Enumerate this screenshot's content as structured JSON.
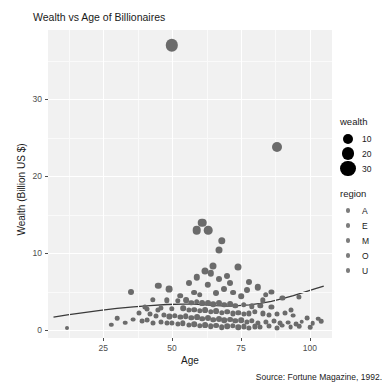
{
  "chart_data": {
    "type": "scatter",
    "title": "Wealth vs Age of Billionaires",
    "xlabel": "Age",
    "ylabel": "Wealth (Billion US $)",
    "caption": "Source: Fortune Magazine, 1992.",
    "xlim": [
      5,
      108
    ],
    "ylim": [
      -1,
      39
    ],
    "xticks": [
      25,
      50,
      75,
      100
    ],
    "yticks": [
      0,
      10,
      20,
      30
    ],
    "xtick_labels": [
      "25",
      "50",
      "75",
      "100"
    ],
    "ytick_labels": [
      "0",
      "10",
      "20",
      "30"
    ],
    "grid": true,
    "legend_position": "right",
    "point_color": "#6b6b6b",
    "panel_color": "#f1f1f1",
    "grid_color": "#ffffff",
    "trend_color": "#3a3a3a",
    "legends": [
      {
        "title": "wealth",
        "type": "size",
        "entries": [
          {
            "label": "10",
            "size": 5
          },
          {
            "label": "20",
            "size": 6.4
          },
          {
            "label": "30",
            "size": 7.6
          }
        ]
      },
      {
        "title": "region",
        "type": "color",
        "entries": [
          {
            "label": "A",
            "size": 2.2
          },
          {
            "label": "E",
            "size": 2.2
          },
          {
            "label": "M",
            "size": 2.2
          },
          {
            "label": "O",
            "size": 2.2
          },
          {
            "label": "U",
            "size": 2.2
          }
        ]
      }
    ],
    "trend_line": [
      [
        7,
        1.7
      ],
      [
        12,
        2.0
      ],
      [
        18,
        2.3
      ],
      [
        24,
        2.6
      ],
      [
        30,
        2.85
      ],
      [
        36,
        3.05
      ],
      [
        42,
        3.2
      ],
      [
        48,
        3.35
      ],
      [
        54,
        3.4
      ],
      [
        58,
        3.4
      ],
      [
        62,
        3.3
      ],
      [
        66,
        3.2
      ],
      [
        70,
        3.15
      ],
      [
        74,
        3.2
      ],
      [
        78,
        3.3
      ],
      [
        82,
        3.5
      ],
      [
        86,
        3.75
      ],
      [
        90,
        4.1
      ],
      [
        94,
        4.5
      ],
      [
        98,
        4.95
      ],
      [
        102,
        5.4
      ],
      [
        105,
        5.75
      ]
    ],
    "points": [
      {
        "x": 50,
        "y": 37.0,
        "r": 6.2
      },
      {
        "x": 88,
        "y": 23.8,
        "r": 5.0
      },
      {
        "x": 61,
        "y": 14.0,
        "r": 4.3
      },
      {
        "x": 59,
        "y": 13.0,
        "r": 4.3
      },
      {
        "x": 63,
        "y": 13.0,
        "r": 4.3
      },
      {
        "x": 68,
        "y": 11.6,
        "r": 3.7
      },
      {
        "x": 67,
        "y": 10.4,
        "r": 3.5
      },
      {
        "x": 65,
        "y": 8.3,
        "r": 3.5
      },
      {
        "x": 74,
        "y": 8.2,
        "r": 3.5
      },
      {
        "x": 62,
        "y": 7.7,
        "r": 3.5
      },
      {
        "x": 64,
        "y": 7.4,
        "r": 3.2
      },
      {
        "x": 56,
        "y": 6.2,
        "r": 3.0
      },
      {
        "x": 71,
        "y": 6.1,
        "r": 3.0
      },
      {
        "x": 45,
        "y": 5.8,
        "r": 3.2
      },
      {
        "x": 81,
        "y": 5.6,
        "r": 3.2
      },
      {
        "x": 35,
        "y": 5.0,
        "r": 3.0
      },
      {
        "x": 49,
        "y": 5.4,
        "r": 3.4
      },
      {
        "x": 69,
        "y": 5.3,
        "r": 3.0
      },
      {
        "x": 77,
        "y": 5.2,
        "r": 3.0
      },
      {
        "x": 58,
        "y": 4.9,
        "r": 2.9
      },
      {
        "x": 66,
        "y": 4.8,
        "r": 3.0
      },
      {
        "x": 72,
        "y": 4.9,
        "r": 2.9
      },
      {
        "x": 53,
        "y": 4.5,
        "r": 2.8
      },
      {
        "x": 60,
        "y": 4.6,
        "r": 2.8
      },
      {
        "x": 75,
        "y": 4.4,
        "r": 2.8
      },
      {
        "x": 84,
        "y": 4.6,
        "r": 2.8
      },
      {
        "x": 90,
        "y": 4.2,
        "r": 2.6
      },
      {
        "x": 96,
        "y": 4.3,
        "r": 2.6
      },
      {
        "x": 43,
        "y": 4.0,
        "r": 2.7
      },
      {
        "x": 48,
        "y": 3.9,
        "r": 2.7
      },
      {
        "x": 52,
        "y": 3.8,
        "r": 2.7
      },
      {
        "x": 55,
        "y": 3.9,
        "r": 2.9
      },
      {
        "x": 57,
        "y": 3.6,
        "r": 2.7
      },
      {
        "x": 59,
        "y": 3.7,
        "r": 2.8
      },
      {
        "x": 61,
        "y": 3.5,
        "r": 2.9
      },
      {
        "x": 63,
        "y": 3.6,
        "r": 3.0
      },
      {
        "x": 65,
        "y": 3.4,
        "r": 2.8
      },
      {
        "x": 67,
        "y": 3.5,
        "r": 3.0
      },
      {
        "x": 69,
        "y": 3.3,
        "r": 2.8
      },
      {
        "x": 71,
        "y": 3.4,
        "r": 2.9
      },
      {
        "x": 73,
        "y": 3.2,
        "r": 2.7
      },
      {
        "x": 76,
        "y": 3.3,
        "r": 2.8
      },
      {
        "x": 79,
        "y": 3.1,
        "r": 2.7
      },
      {
        "x": 82,
        "y": 3.2,
        "r": 2.7
      },
      {
        "x": 86,
        "y": 3.0,
        "r": 2.6
      },
      {
        "x": 40,
        "y": 3.0,
        "r": 2.6
      },
      {
        "x": 46,
        "y": 2.9,
        "r": 2.6
      },
      {
        "x": 50,
        "y": 2.8,
        "r": 2.7
      },
      {
        "x": 54,
        "y": 2.9,
        "r": 2.8
      },
      {
        "x": 56,
        "y": 2.6,
        "r": 2.6
      },
      {
        "x": 58,
        "y": 2.7,
        "r": 2.8
      },
      {
        "x": 60,
        "y": 2.5,
        "r": 2.7
      },
      {
        "x": 62,
        "y": 2.6,
        "r": 2.9
      },
      {
        "x": 64,
        "y": 2.4,
        "r": 2.7
      },
      {
        "x": 66,
        "y": 2.5,
        "r": 2.9
      },
      {
        "x": 68,
        "y": 2.3,
        "r": 2.7
      },
      {
        "x": 70,
        "y": 2.4,
        "r": 2.8
      },
      {
        "x": 72,
        "y": 2.2,
        "r": 2.6
      },
      {
        "x": 74,
        "y": 2.3,
        "r": 2.7
      },
      {
        "x": 76,
        "y": 2.1,
        "r": 2.6
      },
      {
        "x": 78,
        "y": 2.2,
        "r": 2.6
      },
      {
        "x": 80,
        "y": 2.4,
        "r": 2.7
      },
      {
        "x": 83,
        "y": 2.2,
        "r": 2.6
      },
      {
        "x": 85,
        "y": 2.0,
        "r": 2.5
      },
      {
        "x": 88,
        "y": 2.1,
        "r": 2.5
      },
      {
        "x": 91,
        "y": 2.3,
        "r": 2.5
      },
      {
        "x": 94,
        "y": 1.9,
        "r": 2.4
      },
      {
        "x": 99,
        "y": 1.6,
        "r": 2.4
      },
      {
        "x": 103,
        "y": 1.5,
        "r": 2.3
      },
      {
        "x": 38,
        "y": 2.2,
        "r": 2.5
      },
      {
        "x": 42,
        "y": 2.1,
        "r": 2.5
      },
      {
        "x": 44,
        "y": 1.9,
        "r": 2.5
      },
      {
        "x": 47,
        "y": 2.0,
        "r": 2.6
      },
      {
        "x": 49,
        "y": 1.8,
        "r": 2.6
      },
      {
        "x": 51,
        "y": 1.9,
        "r": 2.7
      },
      {
        "x": 53,
        "y": 1.7,
        "r": 2.6
      },
      {
        "x": 55,
        "y": 1.8,
        "r": 2.8
      },
      {
        "x": 57,
        "y": 1.6,
        "r": 2.7
      },
      {
        "x": 59,
        "y": 1.7,
        "r": 2.9
      },
      {
        "x": 61,
        "y": 1.5,
        "r": 2.8
      },
      {
        "x": 63,
        "y": 1.6,
        "r": 3.0
      },
      {
        "x": 65,
        "y": 1.4,
        "r": 2.8
      },
      {
        "x": 67,
        "y": 1.5,
        "r": 3.0
      },
      {
        "x": 69,
        "y": 1.3,
        "r": 2.8
      },
      {
        "x": 71,
        "y": 1.4,
        "r": 2.9
      },
      {
        "x": 73,
        "y": 1.2,
        "r": 2.7
      },
      {
        "x": 75,
        "y": 1.3,
        "r": 2.8
      },
      {
        "x": 77,
        "y": 1.1,
        "r": 2.6
      },
      {
        "x": 79,
        "y": 1.2,
        "r": 2.7
      },
      {
        "x": 81,
        "y": 1.0,
        "r": 2.6
      },
      {
        "x": 84,
        "y": 1.1,
        "r": 2.6
      },
      {
        "x": 87,
        "y": 1.2,
        "r": 2.5
      },
      {
        "x": 89,
        "y": 0.9,
        "r": 2.5
      },
      {
        "x": 92,
        "y": 1.0,
        "r": 2.4
      },
      {
        "x": 95,
        "y": 0.8,
        "r": 2.4
      },
      {
        "x": 97,
        "y": 1.1,
        "r": 2.3
      },
      {
        "x": 101,
        "y": 0.9,
        "r": 2.3
      },
      {
        "x": 104,
        "y": 1.2,
        "r": 2.3
      },
      {
        "x": 36,
        "y": 1.4,
        "r": 2.4
      },
      {
        "x": 39,
        "y": 1.2,
        "r": 2.4
      },
      {
        "x": 41,
        "y": 1.3,
        "r": 2.4
      },
      {
        "x": 43,
        "y": 1.0,
        "r": 2.5
      },
      {
        "x": 46,
        "y": 1.1,
        "r": 2.5
      },
      {
        "x": 48,
        "y": 0.9,
        "r": 2.5
      },
      {
        "x": 50,
        "y": 1.0,
        "r": 2.6
      },
      {
        "x": 52,
        "y": 0.8,
        "r": 2.6
      },
      {
        "x": 54,
        "y": 0.9,
        "r": 2.7
      },
      {
        "x": 56,
        "y": 0.7,
        "r": 2.6
      },
      {
        "x": 58,
        "y": 0.8,
        "r": 2.8
      },
      {
        "x": 60,
        "y": 0.6,
        "r": 2.7
      },
      {
        "x": 62,
        "y": 0.7,
        "r": 2.9
      },
      {
        "x": 64,
        "y": 0.5,
        "r": 2.8
      },
      {
        "x": 66,
        "y": 0.6,
        "r": 2.9
      },
      {
        "x": 68,
        "y": 0.4,
        "r": 2.8
      },
      {
        "x": 70,
        "y": 0.5,
        "r": 2.8
      },
      {
        "x": 72,
        "y": 0.6,
        "r": 2.7
      },
      {
        "x": 74,
        "y": 0.4,
        "r": 2.7
      },
      {
        "x": 76,
        "y": 0.5,
        "r": 2.6
      },
      {
        "x": 78,
        "y": 0.3,
        "r": 2.6
      },
      {
        "x": 80,
        "y": 0.5,
        "r": 2.6
      },
      {
        "x": 82,
        "y": 0.4,
        "r": 2.5
      },
      {
        "x": 85,
        "y": 0.5,
        "r": 2.5
      },
      {
        "x": 88,
        "y": 0.3,
        "r": 2.5
      },
      {
        "x": 90,
        "y": 0.6,
        "r": 2.4
      },
      {
        "x": 93,
        "y": 0.4,
        "r": 2.4
      },
      {
        "x": 96,
        "y": 0.5,
        "r": 2.3
      },
      {
        "x": 100,
        "y": 0.4,
        "r": 2.3
      },
      {
        "x": 12,
        "y": 0.3,
        "r": 2.0
      },
      {
        "x": 30,
        "y": 1.6,
        "r": 2.3
      },
      {
        "x": 33,
        "y": 1.0,
        "r": 2.3
      },
      {
        "x": 28,
        "y": 0.7,
        "r": 2.2
      },
      {
        "x": 59,
        "y": 6.9,
        "r": 3.2
      },
      {
        "x": 70,
        "y": 7.0,
        "r": 3.0
      },
      {
        "x": 63,
        "y": 5.9,
        "r": 3.2
      },
      {
        "x": 78,
        "y": 6.3,
        "r": 3.0
      },
      {
        "x": 67,
        "y": 6.6,
        "r": 3.0
      },
      {
        "x": 83,
        "y": 3.9,
        "r": 2.7
      },
      {
        "x": 86,
        "y": 5.0,
        "r": 2.6
      },
      {
        "x": 93,
        "y": 2.7,
        "r": 2.5
      },
      {
        "x": 45,
        "y": 2.6,
        "r": 2.6
      },
      {
        "x": 41,
        "y": 2.8,
        "r": 2.5
      }
    ]
  }
}
